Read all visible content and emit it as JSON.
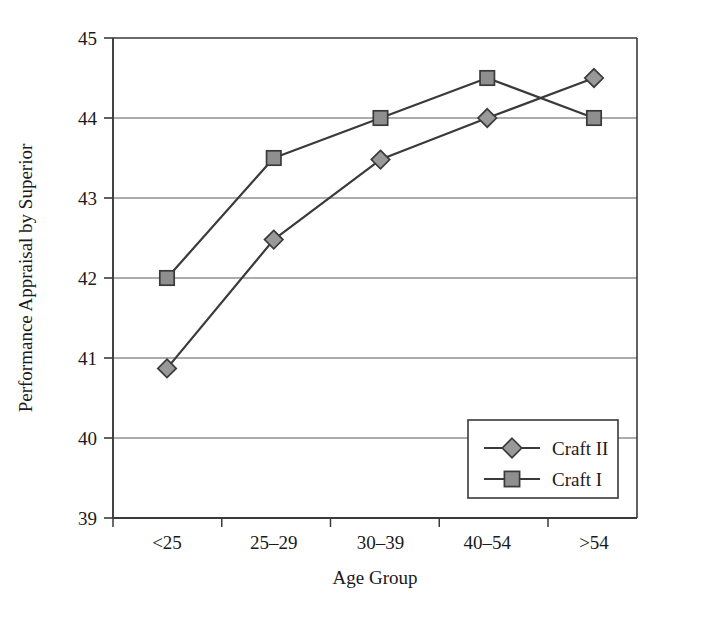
{
  "chart_data": {
    "type": "line",
    "title": "",
    "xlabel": "Age Group",
    "ylabel": "Performance Appraisal by Superior",
    "categories": [
      "<25",
      "25–29",
      "30–39",
      "40–54",
      ">54"
    ],
    "ylim": [
      39,
      45
    ],
    "yticks": [
      39,
      40,
      41,
      42,
      43,
      44,
      45
    ],
    "ytick_labels": [
      "39",
      "40",
      "41",
      "42",
      "43",
      "44",
      "45"
    ],
    "grid": "horizontal",
    "legend_position": "inside-lower-right",
    "series": [
      {
        "name": "Craft II",
        "marker": "diamond",
        "values": [
          40.87,
          42.48,
          43.48,
          44.0,
          44.5
        ],
        "color": "#999999",
        "line_color": "#3a3a3a"
      },
      {
        "name": "Craft I",
        "marker": "square",
        "values": [
          42.0,
          43.5,
          44.0,
          44.5,
          44.0
        ],
        "color": "#8f8f8f",
        "line_color": "#3a3a3a"
      }
    ]
  },
  "axes": {
    "frame_color": "#3a3a3a",
    "grid_color": "#5a5a5a",
    "background": "#ffffff"
  },
  "legend": {
    "entries": [
      {
        "label": "Craft II",
        "marker": "diamond-icon"
      },
      {
        "label": "Craft I",
        "marker": "square-icon"
      }
    ]
  }
}
